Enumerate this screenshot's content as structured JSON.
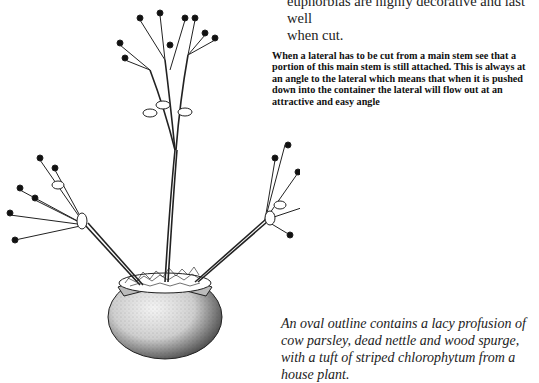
{
  "page": {
    "body_paragraph": {
      "lines": [
        "euphorbias are highly decorative and last well",
        "when cut."
      ]
    },
    "instruction_caption": "When a lateral has to be cut from a main stem see that a portion of this main stem is still attached. This is always at an angle to the lateral which means that when it is pushed down into the container the lateral will flow out at an attractive and easy angle",
    "figure_caption": "An oval outline contains a lacy profusion of cow parsley, dead nettle and wood spurge, with a tuft of striped chlorophytum from a house plant.",
    "illustration": {
      "subject": "euphorbia-arrangement-in-round-pot",
      "style": "black-ink-stipple-drawing"
    }
  }
}
